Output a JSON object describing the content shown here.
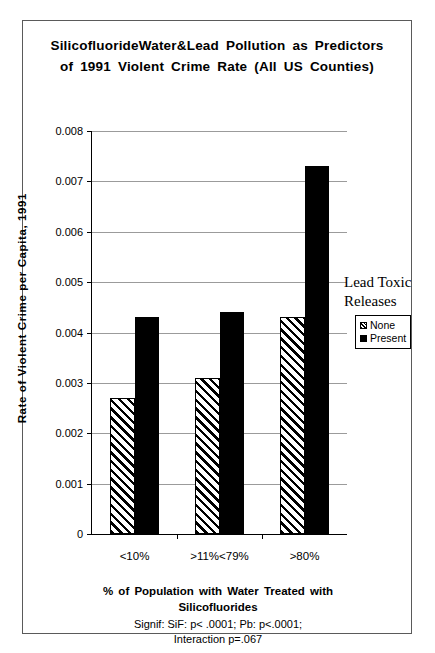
{
  "figure": {
    "title": "SilicofluorideWater&Lead Pollution as Predictors of 1991 Violent Crime Rate (All US Counties)",
    "signif_note_line1": "Signif: SiF: p< .0001; Pb: p<.0001;",
    "signif_note_line2": "Interaction p=.067",
    "legend_title": "Lead Toxic Releases"
  },
  "chart_data": {
    "type": "bar",
    "title": "SilicofluorideWater&Lead Pollution as Predictors of 1991 Violent Crime Rate (All US Counties)",
    "xlabel": "% of Population with Water Treated with Silicofluorides",
    "ylabel": "Rate of Violent Crime per Capita, 1991",
    "categories": [
      "<10%",
      ">11%<79%",
      ">80%"
    ],
    "series": [
      {
        "name": "None",
        "values": [
          0.0027,
          0.0031,
          0.0043
        ],
        "fill": "hatched",
        "color": "#ffffff"
      },
      {
        "name": "Present",
        "values": [
          0.0043,
          0.0044,
          0.0073
        ],
        "fill": "solid",
        "color": "#000000"
      }
    ],
    "ylim": [
      0,
      0.008
    ],
    "ytick_labels": [
      "0",
      "0.001",
      "0.002",
      "0.003",
      "0.004",
      "0.005",
      "0.006",
      "0.007",
      "0.008"
    ],
    "ytick_values": [
      0,
      0.001,
      0.002,
      0.003,
      0.004,
      0.005,
      0.006,
      0.007,
      0.008
    ],
    "grid": true,
    "legend_position": "right",
    "legend_title": "Lead Toxic Releases",
    "annotations": [
      "Signif: SiF: p< .0001; Pb: p<.0001;",
      "Interaction p=.067"
    ]
  }
}
